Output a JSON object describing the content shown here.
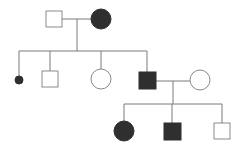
{
  "diagram": {
    "type": "pedigree",
    "colors": {
      "line": "#7a7a7a",
      "affected": "#2f2f2f",
      "unaffected_fill": "#ffffff",
      "unaffected_stroke": "#8a8a8a"
    },
    "generations": [
      {
        "id": "I",
        "individuals": [
          {
            "id": "I-1",
            "sex": "male",
            "affected": false,
            "shape": "square",
            "x": 54,
            "y": 19,
            "size": 16
          },
          {
            "id": "I-2",
            "sex": "female",
            "affected": true,
            "shape": "circle",
            "x": 101,
            "y": 19,
            "r": 10
          }
        ],
        "marriages": [
          {
            "between": [
              "I-1",
              "I-2"
            ],
            "y": 19,
            "x1": 62,
            "x2": 91,
            "descent_x": 77,
            "descent_to_y": 51
          }
        ]
      },
      {
        "id": "II",
        "sibship_line": {
          "y": 51,
          "x1": 19,
          "x2": 147
        },
        "individuals": [
          {
            "id": "II-1",
            "sex": "unknown",
            "affected": true,
            "shape": "small-dot",
            "note": "deceased/miscarriage",
            "x": 19,
            "y": 80,
            "r": 4
          },
          {
            "id": "II-2",
            "sex": "male",
            "affected": false,
            "shape": "square",
            "x": 50,
            "y": 79,
            "size": 16
          },
          {
            "id": "II-3",
            "sex": "female",
            "affected": false,
            "shape": "circle",
            "x": 101,
            "y": 79,
            "r": 10
          },
          {
            "id": "II-4",
            "sex": "male",
            "affected": true,
            "shape": "square",
            "x": 147,
            "y": 80,
            "size": 17
          },
          {
            "id": "II-5",
            "sex": "female",
            "affected": false,
            "shape": "circle",
            "x": 200,
            "y": 80,
            "r": 10,
            "married_in": true
          }
        ],
        "marriages": [
          {
            "between": [
              "II-4",
              "II-5"
            ],
            "y": 81,
            "x1": 156,
            "x2": 190,
            "descent_x": 173,
            "descent_to_y": 104
          }
        ]
      },
      {
        "id": "III",
        "sibship_line": {
          "y": 104,
          "x1": 124,
          "x2": 222
        },
        "individuals": [
          {
            "id": "III-1",
            "sex": "female",
            "affected": true,
            "shape": "circle",
            "x": 124,
            "y": 131,
            "r": 10
          },
          {
            "id": "III-2",
            "sex": "male",
            "affected": true,
            "shape": "square",
            "x": 172,
            "y": 131,
            "size": 17
          },
          {
            "id": "III-3",
            "sex": "male",
            "affected": false,
            "shape": "square",
            "x": 222,
            "y": 131,
            "size": 16
          }
        ]
      }
    ]
  }
}
